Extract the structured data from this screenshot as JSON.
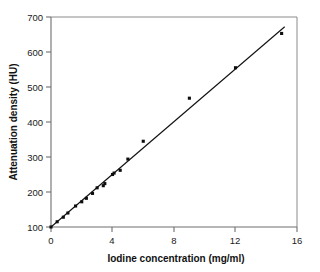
{
  "chart_data": {
    "type": "scatter",
    "title": "",
    "xlabel": "Iodine concentration (mg/ml)",
    "ylabel": "Attenuation density (HU)",
    "xlim": [
      0,
      16
    ],
    "ylim": [
      100,
      700
    ],
    "xticks": [
      0,
      4,
      8,
      12,
      16
    ],
    "yticks": [
      100,
      200,
      300,
      400,
      500,
      600,
      700
    ],
    "xtick_labels": [
      "0",
      "4",
      "8",
      "12",
      "16"
    ],
    "ytick_labels": [
      "100",
      "200",
      "300",
      "400",
      "500",
      "600",
      "700"
    ],
    "grid": false,
    "legend": null,
    "marker": "square",
    "series": [
      {
        "name": "Measured attenuation",
        "x": [
          0.0,
          0.4,
          0.8,
          1.1,
          1.6,
          2.0,
          2.3,
          2.7,
          3.0,
          3.4,
          3.5,
          4.0,
          4.1,
          4.5,
          5.0,
          6.0,
          9.0,
          12.0,
          15.0
        ],
        "y": [
          100,
          115,
          128,
          140,
          160,
          172,
          182,
          196,
          212,
          218,
          224,
          250,
          254,
          262,
          294,
          345,
          468,
          555,
          653
        ]
      }
    ],
    "fit_line": {
      "name": "Linear regression",
      "x": [
        0.0,
        15.2
      ],
      "y": [
        100,
        672
      ],
      "slope": 37.6,
      "intercept": 100
    }
  },
  "axes": {
    "x_axis_name": "iodine-concentration-axis",
    "y_axis_name": "attenuation-density-axis"
  }
}
